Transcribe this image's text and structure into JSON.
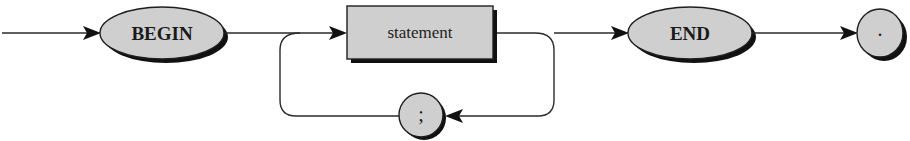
{
  "diagram": {
    "type": "syntax-diagram",
    "nodes": [
      {
        "id": "begin",
        "kind": "terminal",
        "shape": "ellipse",
        "label": "BEGIN"
      },
      {
        "id": "statement",
        "kind": "nonterminal",
        "shape": "rectangle",
        "label": "statement"
      },
      {
        "id": "semicolon",
        "kind": "terminal",
        "shape": "circle",
        "label": ";"
      },
      {
        "id": "end",
        "kind": "terminal",
        "shape": "ellipse",
        "label": "END"
      },
      {
        "id": "period",
        "kind": "terminal",
        "shape": "circle",
        "label": "."
      }
    ],
    "edges": [
      {
        "from": "start",
        "to": "begin"
      },
      {
        "from": "begin",
        "to": "statement"
      },
      {
        "from": "statement",
        "to": "end"
      },
      {
        "from": "statement",
        "to": "semicolon",
        "note": "loop back"
      },
      {
        "from": "semicolon",
        "to": "statement",
        "note": "loop back"
      },
      {
        "from": "end",
        "to": "period"
      }
    ],
    "colors": {
      "node_fill": "#cfcfcf",
      "outline": "#1e1e1e",
      "shadow": "#111111",
      "background": "#ffffff"
    }
  }
}
